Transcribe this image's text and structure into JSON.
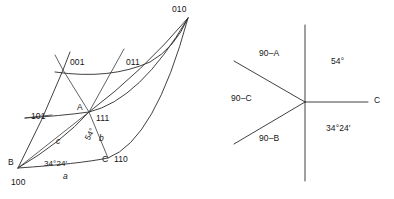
{
  "figure": {
    "kind": "crystallographic-stereographic-projection",
    "left_diagram": {
      "name": "spherical-triangle-ABC",
      "vertices": [
        {
          "id": "B",
          "index": "100",
          "x": 18,
          "y": 168
        },
        {
          "id": "A",
          "index": "111",
          "x": 89,
          "y": 112
        },
        {
          "id": "C",
          "index": "110",
          "x": 108,
          "y": 158
        },
        {
          "id": "010",
          "index": "010",
          "x": 188,
          "y": 18
        }
      ],
      "pole_labels": [
        {
          "text": "010",
          "x": 172,
          "y": 5
        },
        {
          "text": "001",
          "x": 70,
          "y": 58
        },
        {
          "text": "011",
          "x": 126,
          "y": 58
        },
        {
          "text": "101",
          "x": 31,
          "y": 112
        },
        {
          "text": "111",
          "x": 96,
          "y": 114
        },
        {
          "text": "110",
          "x": 114,
          "y": 155
        },
        {
          "text": "100",
          "x": 11,
          "y": 178
        }
      ],
      "point_labels": [
        {
          "text": "A",
          "x": 77,
          "y": 103
        },
        {
          "text": "B",
          "x": 8,
          "y": 158
        },
        {
          "text": "C",
          "x": 102,
          "y": 155
        }
      ],
      "side_labels": [
        {
          "text": "a",
          "x": 63,
          "y": 172
        },
        {
          "text": "b",
          "x": 99,
          "y": 134
        },
        {
          "text": "c",
          "x": 56,
          "y": 137
        }
      ],
      "angle_labels": [
        {
          "text": "34°24′",
          "x": 44,
          "y": 160
        },
        {
          "text": "54°",
          "x": 84,
          "y": 138
        }
      ]
    },
    "right_diagram": {
      "name": "angular-ray-diagram",
      "center": {
        "x": 305,
        "y": 102
      },
      "rays": [
        {
          "id": "ray-up",
          "end_x": 305,
          "end_y": 25
        },
        {
          "id": "ray-down",
          "end_x": 305,
          "end_y": 181
        },
        {
          "id": "ray-right",
          "end_x": 368,
          "end_y": 102
        },
        {
          "id": "ray-upper-left",
          "end_x": 234,
          "end_y": 61
        },
        {
          "id": "ray-lower-left",
          "end_x": 234,
          "end_y": 144
        }
      ],
      "labels": [
        {
          "text": "90–A",
          "x": 259,
          "y": 49
        },
        {
          "text": "90–C",
          "x": 231,
          "y": 94
        },
        {
          "text": "90–B",
          "x": 259,
          "y": 134
        },
        {
          "text": "C",
          "x": 374,
          "y": 96
        },
        {
          "text": "54°",
          "x": 331,
          "y": 57
        },
        {
          "text": "34°24′",
          "x": 326,
          "y": 124
        }
      ]
    },
    "colors": {
      "ink": "#2b2b2b",
      "background": "#ffffff"
    }
  }
}
